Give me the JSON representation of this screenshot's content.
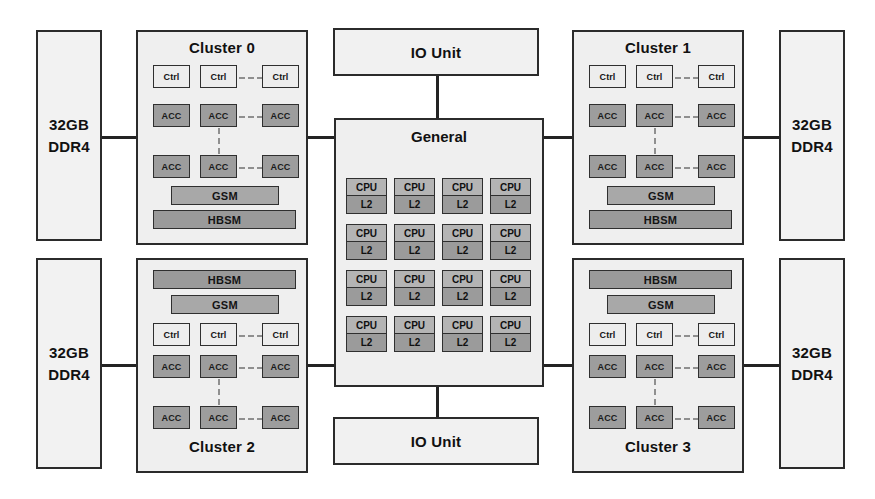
{
  "diagram": {
    "colors": {
      "line": "#232323",
      "block_fill": "#f1f1f1",
      "cluster_fill": "#efefef",
      "acc_fill": "#9d9d9d",
      "ctrl_fill": "#ededed",
      "gsm_fill": "#a8a8a8",
      "hbsm_fill": "#9a9a9a",
      "cpu_fill": "#b4b4b4",
      "l2_fill": "#9b9b9b",
      "dashed": "#8f8f8f"
    }
  },
  "memory": {
    "size_label": "32GB",
    "type_label": "DDR4",
    "blocks": [
      {
        "id": "mem-top-left",
        "size": "32GB",
        "type": "DDR4"
      },
      {
        "id": "mem-bottom-left",
        "size": "32GB",
        "type": "DDR4"
      },
      {
        "id": "mem-top-right",
        "size": "32GB",
        "type": "DDR4"
      },
      {
        "id": "mem-bottom-right",
        "size": "32GB",
        "type": "DDR4"
      }
    ]
  },
  "io_units": [
    {
      "id": "io-top",
      "label": "IO Unit"
    },
    {
      "id": "io-bottom",
      "label": "IO Unit"
    }
  ],
  "general": {
    "title": "General",
    "grid_rows": 4,
    "grid_cols": 4,
    "core_top_label": "CPU",
    "core_bottom_label": "L2",
    "cores": [
      [
        {
          "cpu": "CPU",
          "l2": "L2"
        },
        {
          "cpu": "CPU",
          "l2": "L2"
        },
        {
          "cpu": "CPU",
          "l2": "L2"
        },
        {
          "cpu": "CPU",
          "l2": "L2"
        }
      ],
      [
        {
          "cpu": "CPU",
          "l2": "L2"
        },
        {
          "cpu": "CPU",
          "l2": "L2"
        },
        {
          "cpu": "CPU",
          "l2": "L2"
        },
        {
          "cpu": "CPU",
          "l2": "L2"
        }
      ],
      [
        {
          "cpu": "CPU",
          "l2": "L2"
        },
        {
          "cpu": "CPU",
          "l2": "L2"
        },
        {
          "cpu": "CPU",
          "l2": "L2"
        },
        {
          "cpu": "CPU",
          "l2": "L2"
        }
      ],
      [
        {
          "cpu": "CPU",
          "l2": "L2"
        },
        {
          "cpu": "CPU",
          "l2": "L2"
        },
        {
          "cpu": "CPU",
          "l2": "L2"
        },
        {
          "cpu": "CPU",
          "l2": "L2"
        }
      ]
    ]
  },
  "clusters": [
    {
      "id": "cluster-0",
      "title": "Cluster 0",
      "orientation": "title-top",
      "ctrl_label": "Ctrl",
      "acc_label": "ACC",
      "gsm_label": "GSM",
      "hbsm_label": "HBSM",
      "ctrl_row": [
        "Ctrl",
        "Ctrl",
        "Ctrl"
      ],
      "acc_row_1": [
        "ACC",
        "ACC",
        "ACC"
      ],
      "acc_row_2": [
        "ACC",
        "ACC",
        "ACC"
      ],
      "memory_rows": [
        "GSM",
        "HBSM"
      ]
    },
    {
      "id": "cluster-1",
      "title": "Cluster 1",
      "orientation": "title-top",
      "ctrl_label": "Ctrl",
      "acc_label": "ACC",
      "gsm_label": "GSM",
      "hbsm_label": "HBSM",
      "ctrl_row": [
        "Ctrl",
        "Ctrl",
        "Ctrl"
      ],
      "acc_row_1": [
        "ACC",
        "ACC",
        "ACC"
      ],
      "acc_row_2": [
        "ACC",
        "ACC",
        "ACC"
      ],
      "memory_rows": [
        "GSM",
        "HBSM"
      ]
    },
    {
      "id": "cluster-2",
      "title": "Cluster 2",
      "orientation": "title-bottom",
      "ctrl_label": "Ctrl",
      "acc_label": "ACC",
      "gsm_label": "GSM",
      "hbsm_label": "HBSM",
      "ctrl_row": [
        "Ctrl",
        "Ctrl",
        "Ctrl"
      ],
      "acc_row_1": [
        "ACC",
        "ACC",
        "ACC"
      ],
      "acc_row_2": [
        "ACC",
        "ACC",
        "ACC"
      ],
      "memory_rows": [
        "HBSM",
        "GSM"
      ]
    },
    {
      "id": "cluster-3",
      "title": "Cluster 3",
      "orientation": "title-bottom",
      "ctrl_label": "Ctrl",
      "acc_label": "ACC",
      "gsm_label": "GSM",
      "hbsm_label": "HBSM",
      "ctrl_row": [
        "Ctrl",
        "Ctrl",
        "Ctrl"
      ],
      "acc_row_1": [
        "ACC",
        "ACC",
        "ACC"
      ],
      "acc_row_2": [
        "ACC",
        "ACC",
        "ACC"
      ],
      "memory_rows": [
        "HBSM",
        "GSM"
      ]
    }
  ]
}
